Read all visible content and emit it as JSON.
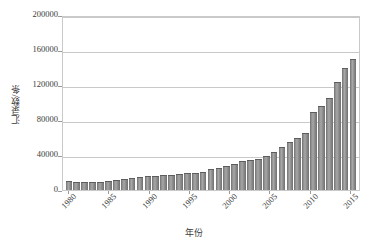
{
  "chart_data": {
    "type": "bar",
    "title": "",
    "subtitle": "",
    "xlabel": "年份",
    "ylabel": "汇录数/条",
    "ylim": [
      0,
      200000
    ],
    "ytick_step": 40000,
    "ytick_labels": [
      "0",
      "40000",
      "80000",
      "120000",
      "160000",
      "200000"
    ],
    "ytick_values": [
      0,
      40000,
      80000,
      120000,
      160000,
      200000
    ],
    "xtick_labels": [
      "1980",
      "1985",
      "1990",
      "1995",
      "2000",
      "2005",
      "2010",
      "2015"
    ],
    "xtick_values": [
      1980,
      1985,
      1990,
      1995,
      2000,
      2005,
      2010,
      2015
    ],
    "grid": true,
    "legend": false,
    "bar_color": "#8d8d8d",
    "bar_edge_color": "#5d5d5d",
    "gridline_color": "#c9c9c9",
    "axis_color": "#c9c9c9",
    "text_color": "#3b3b3b",
    "categories": [
      1980,
      1981,
      1982,
      1983,
      1984,
      1985,
      1986,
      1987,
      1988,
      1989,
      1990,
      1991,
      1992,
      1993,
      1994,
      1995,
      1996,
      1997,
      1998,
      1999,
      2000,
      2001,
      2002,
      2003,
      2004,
      2005,
      2006,
      2007,
      2008,
      2009,
      2010,
      2011,
      2012,
      2013,
      2014,
      2015,
      2016
    ],
    "values": [
      10000,
      9000,
      9000,
      9500,
      9500,
      10000,
      11000,
      13000,
      13500,
      14500,
      15500,
      16500,
      17000,
      17500,
      18500,
      19000,
      19500,
      20500,
      23500,
      25500,
      27000,
      29500,
      33000,
      34500,
      36000,
      39000,
      43000,
      49000,
      55000,
      60000,
      65000,
      89000,
      96000,
      105000,
      124000,
      140000,
      150000
    ],
    "bar_count": 37
  }
}
